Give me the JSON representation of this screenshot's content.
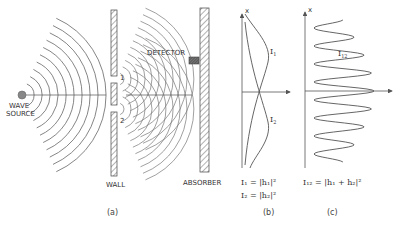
{
  "diagram": {
    "panel_a": {
      "source_label_line1": "WAVE",
      "source_label_line2": "SOURCE",
      "wall_label": "WALL",
      "absorber_label": "ABSORBER",
      "detector_label": "DETECTOR",
      "slit1_label": "1",
      "slit2_label": "2",
      "caption": "(a)"
    },
    "panel_b": {
      "axis_label": "x",
      "curve1_label": "I",
      "curve1_sub": "1",
      "curve2_label": "I",
      "curve2_sub": "2",
      "eq1": "I₁ = |h₁|²",
      "eq2": "I₂ = |h₂|²",
      "caption": "(b)"
    },
    "panel_c": {
      "axis_label": "x",
      "curve_label": "I",
      "curve_sub": "12",
      "eq": "I₁₂ = |h₁ + h₂|²",
      "caption": "(c)"
    }
  }
}
